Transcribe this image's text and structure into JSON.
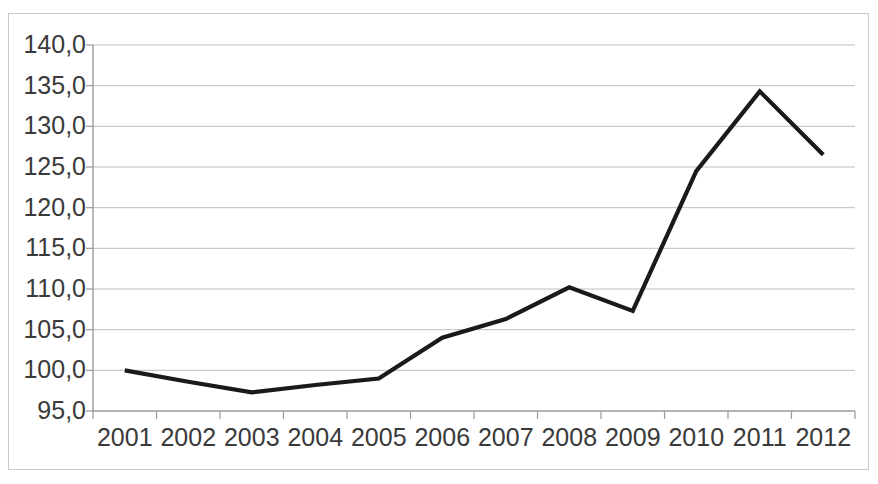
{
  "chart_data": {
    "type": "line",
    "title": "",
    "subtitle": "",
    "xlabel": "",
    "ylabel": "",
    "categories": [
      "2001",
      "2002",
      "2003",
      "2004",
      "2005",
      "2006",
      "2007",
      "2008",
      "2009",
      "2010",
      "2011",
      "2012"
    ],
    "values": [
      100.0,
      98.6,
      97.3,
      98.2,
      99.0,
      104.0,
      106.3,
      110.2,
      107.3,
      124.5,
      134.3,
      126.5
    ],
    "series": [
      {
        "name": "",
        "values": [
          100.0,
          98.6,
          97.3,
          98.2,
          99.0,
          104.0,
          106.3,
          110.2,
          107.3,
          124.5,
          134.3,
          126.5
        ]
      }
    ],
    "ylim": [
      95.0,
      140.0
    ],
    "ytick_step": 5.0,
    "ytick_values": [
      140.0,
      135.0,
      130.0,
      125.0,
      120.0,
      115.0,
      110.0,
      105.0,
      100.0,
      95.0
    ],
    "ytick_labels": [
      "140,0",
      "135,0",
      "130,0",
      "125,0",
      "120,0",
      "115,0",
      "110,0",
      "105,0",
      "100,0",
      "95,0"
    ],
    "decimal_separator": ",",
    "grid": {
      "horizontal": true,
      "vertical": false,
      "color": "#bfbfbf"
    },
    "legend": {
      "visible": false,
      "position": "none",
      "entries": []
    },
    "markers": false,
    "annotations": [],
    "colors": {
      "line": "#1a1a1a",
      "grid": "#bfbfbf",
      "axis": "#9a9a9a",
      "tick_label": "#3a3a3a",
      "plot_background": "#ffffff",
      "frame_border": "#c9c9c9"
    },
    "line_width_px": 4.2,
    "plot_area": {
      "left": 93,
      "right": 855,
      "top": 45,
      "bottom": 411
    }
  }
}
